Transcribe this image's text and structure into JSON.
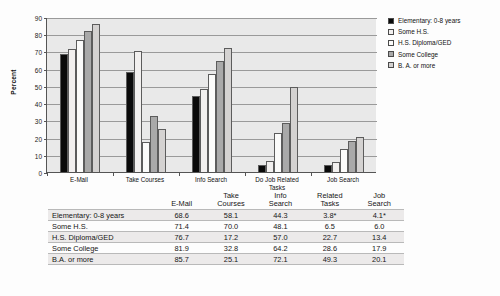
{
  "chart_data": {
    "type": "bar",
    "title": "",
    "xlabel": "",
    "ylabel": "Percent",
    "ylim": [
      0,
      90
    ],
    "yticks": [
      0,
      10,
      20,
      30,
      40,
      50,
      60,
      70,
      80,
      90
    ],
    "grid": true,
    "legend_position": "right",
    "categories": [
      "E-Mail",
      "Take Courses",
      "Info Search",
      "Do Job Related\nTasks",
      "Job Search"
    ],
    "series": [
      {
        "name": "Elementary: 0-8 years",
        "color": "#0a0a0a",
        "values": [
          68.6,
          58.1,
          44.3,
          3.8,
          4.1
        ]
      },
      {
        "name": "Some H.S.",
        "color": "#f2f0ef",
        "values": [
          71.4,
          70.0,
          48.1,
          6.5,
          6.0
        ]
      },
      {
        "name": "H.S. Diploma/GED",
        "color": "#fbfbfa",
        "values": [
          76.7,
          17.2,
          57.0,
          22.7,
          13.4
        ]
      },
      {
        "name": "Some College",
        "color": "#a9a9a9",
        "values": [
          81.9,
          32.8,
          64.2,
          28.6,
          17.9
        ]
      },
      {
        "name": "B. A. or more",
        "color": "#d4d2d1",
        "values": [
          85.7,
          25.1,
          72.1,
          49.3,
          20.1
        ]
      }
    ]
  },
  "legend": {
    "items": [
      {
        "label": "Elementary: 0-8 years",
        "color": "#0a0a0a"
      },
      {
        "label": "Some H.S.",
        "color": "#f2f0ef"
      },
      {
        "label": "H.S. Diploma/GED",
        "color": "#fbfbfa"
      },
      {
        "label": "Some College",
        "color": "#a9a9a9"
      },
      {
        "label": "B. A. or more",
        "color": "#d4d2d1"
      }
    ]
  },
  "table": {
    "rowhead_label": "",
    "columns": [
      "E-Mail",
      "Take\nCourses",
      "Info\nSearch",
      "Related\nTasks",
      "Job\nSearch"
    ],
    "rows": [
      {
        "label": "Elementary: 0-8 years",
        "values": [
          "68.6",
          "58.1",
          "44.3",
          "3.8*",
          "4.1*"
        ]
      },
      {
        "label": "Some H.S.",
        "values": [
          "71.4",
          "70.0",
          "48.1",
          "6.5",
          "6.0"
        ]
      },
      {
        "label": "H.S. Diploma/GED",
        "values": [
          "76.7",
          "17.2",
          "57.0",
          "22.7",
          "13.4"
        ]
      },
      {
        "label": "Some College",
        "values": [
          "81.9",
          "32.8",
          "64.2",
          "28.6",
          "17.9"
        ]
      },
      {
        "label": "B.A. or more",
        "values": [
          "85.7",
          "25.1",
          "72.1",
          "49.3",
          "20.1"
        ]
      }
    ]
  }
}
